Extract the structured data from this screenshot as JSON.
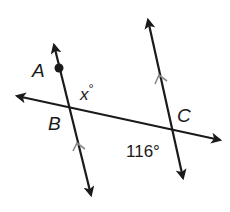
{
  "diagram": {
    "type": "geometry",
    "colors": {
      "line": "#1a1a1a",
      "parallel_mark": "#8a8a8a",
      "background": "#ffffff"
    },
    "points": [
      {
        "name": "A",
        "label": "A"
      },
      {
        "name": "B",
        "label": "B"
      },
      {
        "name": "C",
        "label": "C"
      }
    ],
    "angles": [
      {
        "name": "angle-x",
        "label": "x°",
        "variable": "x",
        "at": "B"
      },
      {
        "name": "angle-116",
        "label": "116°",
        "value": 116,
        "at": "C"
      }
    ],
    "labels": {
      "A": "A",
      "B": "B",
      "C": "C",
      "x_var": "x",
      "x_deg": "°",
      "angle_116": "116°"
    },
    "lines": [
      {
        "name": "line-AB",
        "through": [
          "A",
          "B"
        ],
        "parallel_mark": true
      },
      {
        "name": "line-C",
        "through": [
          "C"
        ],
        "parallel_mark": true
      },
      {
        "name": "transversal-BC",
        "through": [
          "B",
          "C"
        ]
      }
    ]
  }
}
